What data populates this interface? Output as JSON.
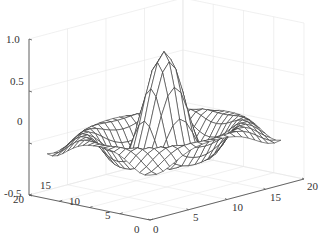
{
  "chart_data": {
    "type": "surface",
    "title": "",
    "xlabel": "",
    "ylabel": "",
    "zlabel": "",
    "x_ticks": [
      0,
      5,
      10,
      15,
      20
    ],
    "y_ticks": [
      0,
      5,
      10,
      15,
      20
    ],
    "z_ticks": [
      "1.0",
      "0.5",
      "0",
      "-0.5"
    ],
    "xlim": [
      0,
      20
    ],
    "ylim": [
      0,
      20
    ],
    "zlim": [
      -0.5,
      1.0
    ],
    "grid": true,
    "mesh": {
      "function": "sin(r)/r",
      "grid_points": 21,
      "domain_xy": [
        0,
        17
      ],
      "center": [
        8.5,
        8.5
      ],
      "radial_scale": 0.95,
      "peak_z": 0.85
    },
    "colors": {
      "mesh": "#333333",
      "axis": "#555555",
      "grid": "#e6e6e6"
    }
  },
  "axes": {
    "z_labels": [
      {
        "text": "1.0",
        "x": 6,
        "y": 34
      },
      {
        "text": "0.5",
        "x": 10,
        "y": 76
      },
      {
        "text": "0",
        "x": 17,
        "y": 116
      },
      {
        "text": "-0.5",
        "x": 4,
        "y": 188
      }
    ],
    "y_labels": [
      {
        "text": "20",
        "x": 13,
        "y": 194
      },
      {
        "text": "15",
        "x": 40,
        "y": 180
      },
      {
        "text": "10",
        "x": 69,
        "y": 196
      },
      {
        "text": "5",
        "x": 105,
        "y": 210
      },
      {
        "text": "0",
        "x": 134,
        "y": 224
      }
    ],
    "x_labels": [
      {
        "text": "0",
        "x": 153,
        "y": 224
      },
      {
        "text": "5",
        "x": 193,
        "y": 212
      },
      {
        "text": "10",
        "x": 232,
        "y": 202
      },
      {
        "text": "15",
        "x": 270,
        "y": 192
      },
      {
        "text": "20",
        "x": 307,
        "y": 181
      }
    ]
  }
}
